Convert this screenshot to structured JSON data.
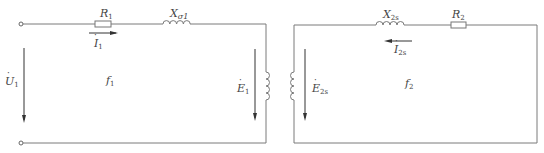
{
  "diagram": {
    "type": "equivalent-circuit",
    "primary": {
      "resistor": {
        "symbol": "R",
        "sub": "1"
      },
      "reactance": {
        "symbol": "X",
        "sub": "σ1"
      },
      "current": {
        "symbol": "I",
        "sub": "1",
        "dot": "·"
      },
      "voltage": {
        "symbol": "U",
        "sub": "1",
        "dot": "·"
      },
      "emf": {
        "symbol": "E",
        "sub": "1",
        "dot": "·"
      },
      "frequency": {
        "symbol": "f",
        "sub": "1"
      }
    },
    "secondary": {
      "resistor": {
        "symbol": "R",
        "sub": "2"
      },
      "reactance": {
        "symbol": "X",
        "sub": "2s"
      },
      "current": {
        "symbol": "I",
        "sub": "2s",
        "dot": "·"
      },
      "emf": {
        "symbol": "E",
        "sub": "2s",
        "dot": "·"
      },
      "frequency": {
        "symbol": "f",
        "sub": "2"
      }
    },
    "colors": {
      "wire": "#7a7a7a",
      "text": "#444444",
      "arrow": "#333333"
    }
  }
}
